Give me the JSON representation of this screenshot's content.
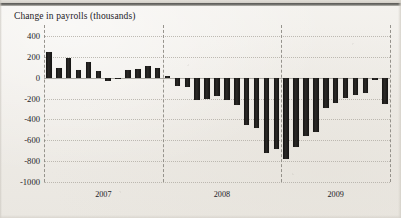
{
  "chart_data": {
    "type": "bar",
    "title": "Change in payrolls (thousands)",
    "xlabel": "",
    "ylabel": "",
    "ylim": [
      -1000,
      400
    ],
    "yticks": [
      400,
      200,
      0,
      -200,
      -400,
      -600,
      -800,
      -1000
    ],
    "ytick_labels": [
      "400",
      "200",
      "0",
      "-200",
      "-400",
      "-600",
      "-800",
      "-1000"
    ],
    "grid": "horizontal-dotted-and-vertical-dashed-year-separators",
    "legend": "none",
    "bar_color": "#1a1918",
    "year_labels": [
      "2007",
      "2008",
      "2009"
    ],
    "year_separator_values": [
      "2008",
      "2009"
    ],
    "categories": [
      "2007-01",
      "2007-02",
      "2007-03",
      "2007-04",
      "2007-05",
      "2007-06",
      "2007-07",
      "2007-08",
      "2007-09",
      "2007-10",
      "2007-11",
      "2007-12",
      "2008-01",
      "2008-02",
      "2008-03",
      "2008-04",
      "2008-05",
      "2008-06",
      "2008-07",
      "2008-08",
      "2008-09",
      "2008-10",
      "2008-11",
      "2008-12",
      "2009-01",
      "2009-02",
      "2009-03",
      "2009-04",
      "2009-05",
      "2009-06",
      "2009-07",
      "2009-08",
      "2009-09",
      "2009-10",
      "2009-11"
    ],
    "values": [
      250,
      90,
      190,
      75,
      150,
      60,
      -30,
      -15,
      75,
      85,
      110,
      90,
      20,
      -80,
      -85,
      -210,
      -200,
      -180,
      -215,
      -260,
      -450,
      -480,
      -720,
      -680,
      -780,
      -660,
      -560,
      -520,
      -290,
      -240,
      -195,
      -170,
      -150,
      -20,
      -250
    ]
  },
  "axis": {
    "y_tick_labels": [
      "400",
      "200",
      "0",
      "-200",
      "-400",
      "-600",
      "-800",
      "-1000"
    ],
    "x_tick_labels": [
      "2007",
      "2008",
      "2009"
    ]
  }
}
